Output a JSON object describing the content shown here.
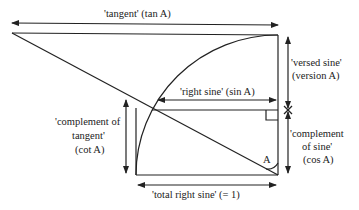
{
  "labels": {
    "tangent": "'tangent' (tan A)",
    "versed_sine_1": "'versed sine'",
    "versed_sine_2": "(version A)",
    "right_sine": "'right sine' (sin A)",
    "comp_tangent_1": "'complement of",
    "comp_tangent_2": "tangent'",
    "comp_tangent_3": "(cot A)",
    "comp_sine_1": "'complement",
    "comp_sine_2": "of sine'",
    "comp_sine_3": "(cos A)",
    "angle": "A",
    "total_sine": "'total right sine' (= 1)"
  },
  "colors": {
    "line": "#222222",
    "background": "#ffffff"
  }
}
